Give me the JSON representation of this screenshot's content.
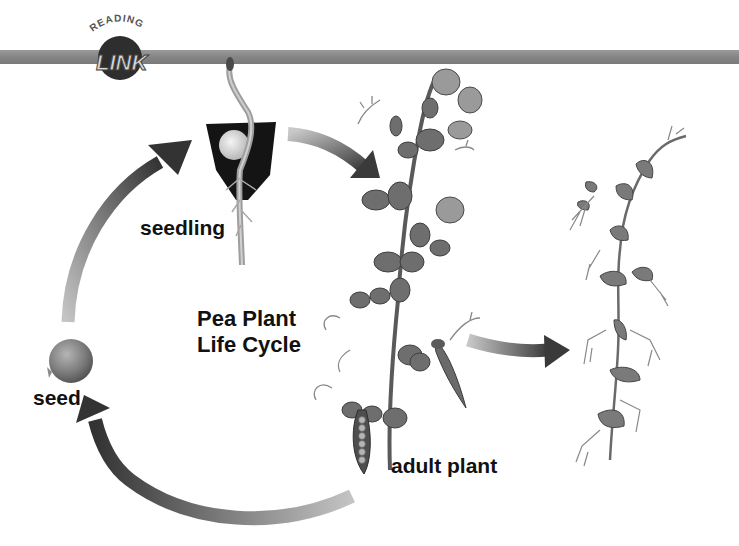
{
  "logo": {
    "top_text": "READING",
    "main_text": "LINK"
  },
  "header_bar": {
    "color": "#8a8a8a"
  },
  "diagram": {
    "title_line1": "Pea Plant",
    "title_line2": "Life Cycle",
    "stages": [
      {
        "id": "seedling",
        "label": "seedling"
      },
      {
        "id": "adult-plant",
        "label": "adult plant"
      },
      {
        "id": "seed",
        "label": "seed"
      },
      {
        "id": "dead-plant",
        "label": ""
      }
    ],
    "arrows": [
      {
        "from": "seed",
        "to": "seedling"
      },
      {
        "from": "seedling",
        "to": "adult-plant"
      },
      {
        "from": "adult-plant",
        "to": "seed"
      },
      {
        "from": "adult-plant",
        "to": "dead-plant"
      }
    ],
    "colors": {
      "arrow_dark": "#3a3a3a",
      "arrow_light": "#bdbdbd",
      "leaf": "#6e6e6e",
      "leaf_dark": "#4a4a4a",
      "soil": "#141414",
      "seed": "#7a7a7a",
      "text": "#111111"
    }
  }
}
